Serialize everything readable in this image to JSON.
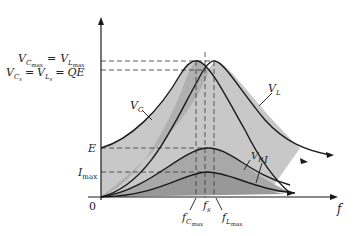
{
  "diagram": {
    "type": "series resonance frequency response",
    "axes": {
      "x_label": "f",
      "origin_label": "0"
    },
    "y_labels": {
      "vmax_left": "V",
      "vmax_left_sub": "C",
      "vmax_left_subsub": "max",
      "vmax_eq": "=",
      "vmax_right": "V",
      "vmax_right_sub": "L",
      "vmax_right_subsub": "max",
      "vs_left": "V",
      "vs_left_sub": "C",
      "vs_left_subsub": "s",
      "vs_eq1": "=",
      "vs_mid": "V",
      "vs_mid_sub": "L",
      "vs_mid_subsub": "s",
      "vs_eq2": "=",
      "vs_right": "QE",
      "e": "E",
      "imax": "I",
      "imax_sub": "max"
    },
    "curve_labels": {
      "vc": "V",
      "vc_sub": "C",
      "vl": "V",
      "vl_sub": "L",
      "vr": "V",
      "vr_sub": "R",
      "i": "I"
    },
    "x_labels": {
      "fc": "f",
      "fc_sub": "C",
      "fc_subsub": "max",
      "fs": "f",
      "fs_sub": "s",
      "fl": "f",
      "fl_sub": "L",
      "fl_subsub": "max"
    },
    "colors": {
      "fill_light": "#c8c8c8",
      "fill_mid": "#b4b4b4",
      "fill_dark": "#a0a0a0",
      "stroke": "#1a1a1a"
    }
  }
}
